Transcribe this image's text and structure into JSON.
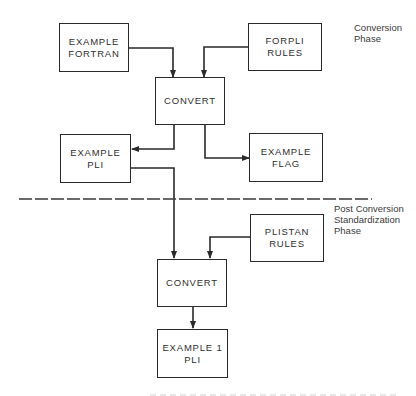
{
  "diagram": {
    "type": "flowchart",
    "phases": [
      {
        "id": "conversion",
        "lines": [
          "Conversion",
          "Phase"
        ]
      },
      {
        "id": "post_conversion",
        "lines": [
          "Post Conversion",
          "Standardization",
          "Phase"
        ]
      }
    ],
    "nodes": {
      "example_fortran": {
        "lines": [
          "EXAMPLE",
          "FORTRAN"
        ],
        "phase": "conversion"
      },
      "forpli_rules": {
        "lines": [
          "FORPLI",
          "RULES"
        ],
        "phase": "conversion"
      },
      "convert_1": {
        "lines": [
          "CONVERT"
        ],
        "phase": "conversion"
      },
      "example_pli": {
        "lines": [
          "EXAMPLE",
          "PLI"
        ],
        "phase": "conversion"
      },
      "example_flag": {
        "lines": [
          "EXAMPLE",
          "FLAG"
        ],
        "phase": "conversion"
      },
      "plistan_rules": {
        "lines": [
          "PLISTAN",
          "RULES"
        ],
        "phase": "post_conversion"
      },
      "convert_2": {
        "lines": [
          "CONVERT"
        ],
        "phase": "post_conversion"
      },
      "example_1_pli": {
        "lines": [
          "EXAMPLE 1",
          "PLI"
        ],
        "phase": "post_conversion"
      }
    },
    "edges": [
      {
        "from": "example_fortran",
        "to": "convert_1"
      },
      {
        "from": "forpli_rules",
        "to": "convert_1"
      },
      {
        "from": "convert_1",
        "to": "example_pli"
      },
      {
        "from": "convert_1",
        "to": "example_flag"
      },
      {
        "from": "example_pli",
        "to": "convert_2"
      },
      {
        "from": "plistan_rules",
        "to": "convert_2"
      },
      {
        "from": "convert_2",
        "to": "example_1_pli"
      }
    ],
    "separator": {
      "style": "dashed",
      "between": [
        "conversion",
        "post_conversion"
      ]
    }
  },
  "colors": {
    "line": "#2a2a2a",
    "text": "#2f2f2f",
    "background": "#ffffff"
  }
}
